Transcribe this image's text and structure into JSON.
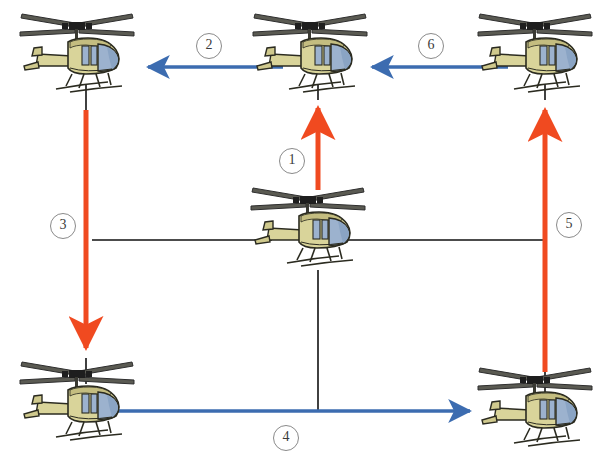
{
  "diagram": {
    "background": "#ffffff",
    "colors": {
      "arrow_blue": "#3c6cb0",
      "arrow_red": "#f04a20",
      "plain_line": "#111111",
      "circle_stroke": "#8a8a8a",
      "circle_text": "#3b3b3b",
      "heli_body": "#d9d49a",
      "heli_body_shade": "#b9b273",
      "heli_glass": "#9cb2ce",
      "heli_glass_dark": "#7e99ba",
      "heli_outline": "#2b2b20",
      "rotor": "#3a3a3a"
    },
    "helicopters": [
      {
        "id": "heli-top-left",
        "label": "helicopter-top-left",
        "x": 12,
        "y": 4
      },
      {
        "id": "heli-top-center",
        "label": "helicopter-top-center",
        "x": 245,
        "y": 4
      },
      {
        "id": "heli-top-right",
        "label": "helicopter-top-right",
        "x": 470,
        "y": 4
      },
      {
        "id": "heli-center",
        "label": "helicopter-center",
        "x": 243,
        "y": 184
      },
      {
        "id": "heli-bottom-left",
        "label": "helicopter-bottom-left",
        "x": 12,
        "y": 352
      },
      {
        "id": "heli-bottom-right",
        "label": "helicopter-bottom-right",
        "x": 455,
        "y": 358
      }
    ],
    "arrows": [
      {
        "id": "arrow-1",
        "label": "1",
        "color": "#f04a20",
        "direction": "up",
        "from": "center helicopter",
        "to": "top-center helicopter"
      },
      {
        "id": "arrow-2",
        "label": "2",
        "color": "#3c6cb0",
        "direction": "left",
        "from": "top-center helicopter",
        "to": "top-left helicopter"
      },
      {
        "id": "arrow-3",
        "label": "3",
        "color": "#f04a20",
        "direction": "down",
        "from": "top-left helicopter",
        "to": "bottom-left helicopter"
      },
      {
        "id": "arrow-4",
        "label": "4",
        "color": "#3c6cb0",
        "direction": "right",
        "from": "bottom-left helicopter",
        "to": "bottom-right helicopter"
      },
      {
        "id": "arrow-5",
        "label": "5",
        "color": "#f04a20",
        "direction": "up",
        "from": "bottom-right helicopter",
        "to": "top-right helicopter"
      },
      {
        "id": "arrow-6",
        "label": "6",
        "color": "#3c6cb0",
        "direction": "left",
        "from": "top-right helicopter",
        "to": "top-center helicopter"
      }
    ],
    "labels": {
      "one": "1",
      "two": "2",
      "three": "3",
      "four": "4",
      "five": "5",
      "six": "6"
    },
    "label_positions": [
      {
        "key": "two",
        "x": 196,
        "y": 33
      },
      {
        "key": "six",
        "x": 418,
        "y": 33
      },
      {
        "key": "one",
        "x": 279,
        "y": 148
      },
      {
        "key": "three",
        "x": 50,
        "y": 213
      },
      {
        "key": "five",
        "x": 556,
        "y": 212
      },
      {
        "key": "four",
        "x": 273,
        "y": 425
      }
    ],
    "plain_lines": [
      {
        "id": "line-center-left",
        "x1": 92,
        "y1": 240,
        "x2": 270,
        "y2": 240
      },
      {
        "id": "line-center-right",
        "x1": 345,
        "y1": 240,
        "x2": 546,
        "y2": 240
      },
      {
        "id": "line-center-down",
        "x1": 318,
        "y1": 272,
        "x2": 318,
        "y2": 412
      },
      {
        "id": "line-left-stub",
        "x1": 86,
        "y1": 82,
        "x2": 86,
        "y2": 108
      },
      {
        "id": "line-topcenter-stub",
        "x1": 318,
        "y1": 82,
        "x2": 318,
        "y2": 100
      },
      {
        "id": "line-topright-stub",
        "x1": 545,
        "y1": 82,
        "x2": 545,
        "y2": 100
      },
      {
        "id": "line-botleft-stub",
        "x1": 86,
        "y1": 360,
        "x2": 86,
        "y2": 382
      },
      {
        "id": "line-botright-stub",
        "x1": 545,
        "y1": 372,
        "x2": 545,
        "y2": 392
      }
    ]
  }
}
